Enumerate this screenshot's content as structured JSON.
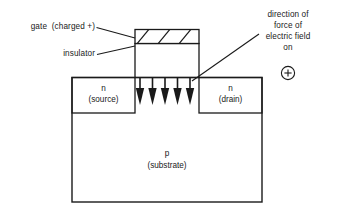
{
  "figure": {
    "type": "mosfet-cross-section-diagram",
    "background_color": "#ffffff",
    "line_color": "#1a1a1a",
    "text_color": "#1a1a1a"
  },
  "labels": {
    "gate": "gate  (charged +)",
    "insulator": "insulator",
    "source_type": "n",
    "source_name": "(source)",
    "drain_type": "n",
    "drain_name": "(drain)",
    "substrate_type": "p",
    "substrate_name": "(substrate)"
  },
  "annotation": {
    "line1": "direction of",
    "line2": "force of",
    "line3": "electric field",
    "line4": "on",
    "charge_symbol": "+"
  },
  "icons": {
    "positive_charge": "circled-plus-icon",
    "field_arrows": "down-arrow-icon",
    "gate_hatch": "diagonal-hatch-pattern"
  },
  "geometry": {
    "arrow_count": 5,
    "hatch_stripe_count": 3
  }
}
